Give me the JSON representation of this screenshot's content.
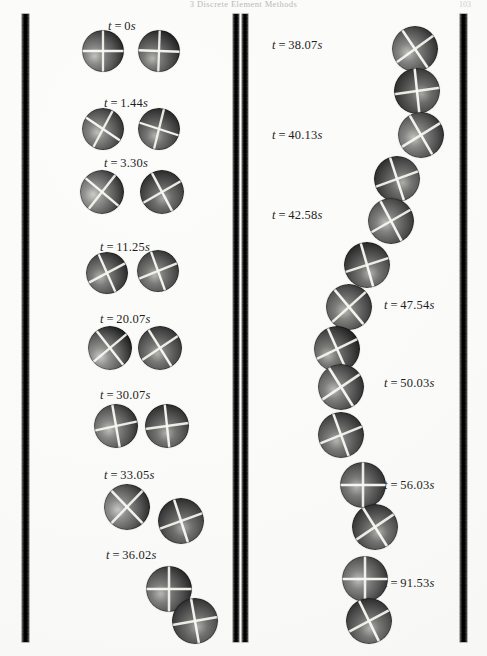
{
  "page": {
    "running_head": "3 Discrete Element Methods",
    "folio": "103",
    "width": 487,
    "height": 656,
    "background_color": "#fafaf8"
  },
  "figure": {
    "caption": "",
    "sphere_diameter_px": 40,
    "wall_color": "#141414",
    "sphere_base_color": "#8a8a8a",
    "sphere_line_color": "#f2f2ee"
  },
  "walls": [
    {
      "name": "left-wall",
      "x": 22,
      "y": 14,
      "w": 7,
      "h": 628
    },
    {
      "name": "middle-wall-left",
      "x": 233,
      "y": 14,
      "w": 6,
      "h": 628
    },
    {
      "name": "middle-wall-right",
      "x": 242,
      "y": 14,
      "w": 6,
      "h": 628
    },
    {
      "name": "right-wall",
      "x": 460,
      "y": 14,
      "w": 7,
      "h": 628
    }
  ],
  "columns": [
    {
      "name": "left-column",
      "steps": [
        {
          "label": "t = 0 s",
          "t": "0",
          "unit": "s",
          "label_x": 108,
          "label_y": 19,
          "spheres": [
            {
              "x": 82,
              "y": 30,
              "d": 42,
              "shade": 0.62,
              "lines": [
                0,
                90
              ],
              "hl": [
                0.3,
                0.62
              ]
            },
            {
              "x": 138,
              "y": 30,
              "d": 42,
              "shade": 0.5,
              "lines": [
                2,
                92
              ],
              "hl": [
                0.34,
                0.68
              ]
            }
          ]
        },
        {
          "label": "t = 1.44 s",
          "t": "1.44",
          "unit": "s",
          "label_x": 104,
          "label_y": 96,
          "spheres": [
            {
              "x": 82,
              "y": 108,
              "d": 42,
              "shade": 0.58,
              "lines": [
                34,
                118
              ],
              "hl": [
                0.36,
                0.58
              ]
            },
            {
              "x": 138,
              "y": 108,
              "d": 42,
              "shade": 0.46,
              "lines": [
                18,
                104
              ],
              "hl": [
                0.4,
                0.66
              ]
            }
          ]
        },
        {
          "label": "t = 3.30 s",
          "t": "3.30",
          "unit": "s",
          "label_x": 104,
          "label_y": 156,
          "spheres": [
            {
              "x": 80,
              "y": 170,
              "d": 44,
              "shade": 0.7,
              "lines": [
                40,
                128
              ],
              "hl": [
                0.3,
                0.56
              ]
            },
            {
              "x": 140,
              "y": 170,
              "d": 44,
              "shade": 0.4,
              "lines": [
                62,
                150
              ],
              "hl": [
                0.52,
                0.64
              ]
            }
          ]
        },
        {
          "label": "t = 11.25 s",
          "t": "11.25",
          "unit": "s",
          "label_x": 100,
          "label_y": 240,
          "spheres": [
            {
              "x": 86,
              "y": 252,
              "d": 42,
              "shade": 0.5,
              "lines": [
                66,
                152
              ],
              "hl": [
                0.34,
                0.6
              ]
            },
            {
              "x": 137,
              "y": 250,
              "d": 42,
              "shade": 0.52,
              "lines": [
                70,
                158
              ],
              "hl": [
                0.42,
                0.6
              ]
            }
          ]
        },
        {
          "label": "t = 20.07 s",
          "t": "20.07",
          "unit": "s",
          "label_x": 100,
          "label_y": 312,
          "spheres": [
            {
              "x": 88,
              "y": 326,
              "d": 44,
              "shade": 0.68,
              "lines": [
                52,
                140
              ],
              "hl": [
                0.28,
                0.7
              ]
            },
            {
              "x": 138,
              "y": 326,
              "d": 44,
              "shade": 0.48,
              "lines": [
                58,
                146
              ],
              "hl": [
                0.44,
                0.62
              ]
            }
          ]
        },
        {
          "label": "t = 30.07 s",
          "t": "30.07",
          "unit": "s",
          "label_x": 100,
          "label_y": 388,
          "spheres": [
            {
              "x": 94,
              "y": 404,
              "d": 44,
              "shade": 0.6,
              "lines": [
                80,
                168
              ],
              "hl": [
                0.34,
                0.58
              ]
            },
            {
              "x": 145,
              "y": 404,
              "d": 44,
              "shade": 0.46,
              "lines": [
                84,
                172
              ],
              "hl": [
                0.48,
                0.66
              ]
            }
          ]
        },
        {
          "label": "t = 33.05 s",
          "t": "33.05",
          "unit": "s",
          "label_x": 104,
          "label_y": 468,
          "spheres": [
            {
              "x": 104,
              "y": 484,
              "d": 46,
              "shade": 0.66,
              "lines": [
                46,
                134
              ],
              "hl": [
                0.3,
                0.56
              ]
            },
            {
              "x": 158,
              "y": 498,
              "d": 46,
              "shade": 0.42,
              "lines": [
                72,
                160
              ],
              "hl": [
                0.54,
                0.64
              ]
            }
          ]
        },
        {
          "label": "t = 36.02 s",
          "t": "36.02",
          "unit": "s",
          "label_x": 106,
          "label_y": 548,
          "spheres": [
            {
              "x": 146,
              "y": 566,
              "d": 46,
              "shade": 0.52,
              "lines": [
                0,
                90
              ],
              "hl": [
                0.32,
                0.6
              ]
            },
            {
              "x": 172,
              "y": 598,
              "d": 46,
              "shade": 0.44,
              "lines": [
                80,
                170
              ],
              "hl": [
                0.56,
                0.62
              ]
            }
          ]
        }
      ]
    },
    {
      "name": "right-column",
      "steps": [
        {
          "label": "t = 38.07 s",
          "t": "38.07",
          "unit": "s",
          "label_x": 272,
          "label_y": 38,
          "spheres": [
            {
              "x": 392,
              "y": 26,
              "d": 46,
              "shade": 0.58,
              "lines": [
                56,
                144
              ],
              "hl": [
                0.34,
                0.58
              ]
            },
            {
              "x": 394,
              "y": 68,
              "d": 46,
              "shade": 0.38,
              "lines": [
                84,
                172
              ],
              "hl": [
                0.6,
                0.56
              ]
            }
          ]
        },
        {
          "label": "t = 40.13 s",
          "t": "40.13",
          "unit": "s",
          "label_x": 272,
          "label_y": 128,
          "spheres": [
            {
              "x": 398,
              "y": 112,
              "d": 46,
              "shade": 0.62,
              "lines": [
                60,
                148
              ],
              "hl": [
                0.34,
                0.56
              ]
            },
            {
              "x": 374,
              "y": 156,
              "d": 46,
              "shade": 0.44,
              "lines": [
                72,
                160
              ],
              "hl": [
                0.62,
                0.58
              ]
            }
          ]
        },
        {
          "label": "t = 42.58 s",
          "t": "42.58",
          "unit": "s",
          "label_x": 272,
          "label_y": 208,
          "spheres": [
            {
              "x": 368,
              "y": 198,
              "d": 46,
              "shade": 0.56,
              "lines": [
                62,
                150
              ],
              "hl": [
                0.38,
                0.54
              ]
            },
            {
              "x": 344,
              "y": 242,
              "d": 46,
              "shade": 0.46,
              "lines": [
                74,
                162
              ],
              "hl": [
                0.56,
                0.68
              ]
            }
          ]
        },
        {
          "label": "t = 47.54 s",
          "t": "47.54",
          "unit": "s",
          "label_x": 384,
          "label_y": 298,
          "spheres": [
            {
              "x": 326,
              "y": 284,
              "d": 46,
              "shade": 0.54,
              "lines": [
                50,
                138
              ],
              "hl": [
                0.4,
                0.58
              ]
            },
            {
              "x": 314,
              "y": 326,
              "d": 46,
              "shade": 0.48,
              "lines": [
                66,
                154
              ],
              "hl": [
                0.3,
                0.64
              ]
            }
          ]
        },
        {
          "label": "t = 50.03 s",
          "t": "50.03",
          "unit": "s",
          "label_x": 384,
          "label_y": 376,
          "spheres": [
            {
              "x": 318,
              "y": 364,
              "d": 46,
              "shade": 0.56,
              "lines": [
                58,
                146
              ],
              "hl": [
                0.34,
                0.56
              ]
            },
            {
              "x": 318,
              "y": 412,
              "d": 46,
              "shade": 0.5,
              "lines": [
                70,
                158
              ],
              "hl": [
                0.4,
                0.62
              ]
            }
          ]
        },
        {
          "label": "t = 56.03 s",
          "t": "56.03",
          "unit": "s",
          "label_x": 384,
          "label_y": 478,
          "spheres": [
            {
              "x": 340,
              "y": 462,
              "d": 46,
              "shade": 0.5,
              "lines": [
                0,
                90
              ],
              "hl": [
                0.36,
                0.54
              ]
            },
            {
              "x": 352,
              "y": 504,
              "d": 46,
              "shade": 0.46,
              "lines": [
                58,
                146
              ],
              "hl": [
                0.56,
                0.62
              ]
            }
          ]
        },
        {
          "label": "t = 91.53 s",
          "t": "91.53",
          "unit": "s",
          "label_x": 384,
          "label_y": 576,
          "spheres": [
            {
              "x": 342,
              "y": 556,
              "d": 46,
              "shade": 0.58,
              "lines": [
                0,
                90
              ],
              "hl": [
                0.36,
                0.52
              ]
            },
            {
              "x": 346,
              "y": 598,
              "d": 46,
              "shade": 0.48,
              "lines": [
                64,
                152
              ],
              "hl": [
                0.52,
                0.66
              ]
            }
          ]
        }
      ]
    }
  ]
}
